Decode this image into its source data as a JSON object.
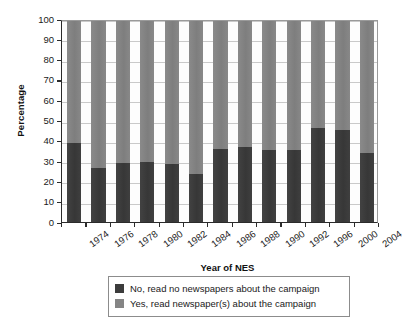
{
  "chart_data": {
    "type": "bar",
    "subtype": "stacked-bar-100-percent",
    "title": "",
    "xlabel": "Year of NES",
    "ylabel": "Percentage",
    "ylim": [
      0,
      100
    ],
    "ytick_step": 10,
    "yticks": [
      0,
      10,
      20,
      30,
      40,
      50,
      60,
      70,
      80,
      90,
      100
    ],
    "grid": true,
    "grid_axis": "y",
    "legend_position": "below-center",
    "categories": [
      "1974",
      "1976",
      "1978",
      "1980",
      "1982",
      "1984",
      "1986",
      "1988",
      "1990",
      "1992",
      "1996",
      "2000",
      "2004"
    ],
    "series": [
      {
        "name": "No, read no newspapers about the campaign",
        "color": "#3c3c3c",
        "values": [
          39,
          26.5,
          29,
          29.5,
          28.5,
          23.5,
          36,
          37,
          35.5,
          35.5,
          46.5,
          45.5,
          34
        ]
      },
      {
        "name": "Yes, read newspaper(s) about the campaign",
        "color": "#858585",
        "values": [
          61,
          73.5,
          71,
          70.5,
          71.5,
          76.5,
          64,
          63,
          64.5,
          64.5,
          53.5,
          54.5,
          66
        ]
      }
    ]
  },
  "axes": {
    "y_title": "Percentage",
    "x_title": "Year of NES",
    "y_tick_labels": [
      "100",
      "90",
      "80",
      "70",
      "60",
      "50",
      "40",
      "30",
      "20",
      "10",
      "0"
    ],
    "x_tick_labels": [
      "1974",
      "1976",
      "1978",
      "1980",
      "1982",
      "1984",
      "1986",
      "1988",
      "1990",
      "1992",
      "1996",
      "2000",
      "2004"
    ]
  },
  "legend": {
    "items": [
      {
        "label": "No, read no newspapers about the campaign",
        "color": "#3c3c3c",
        "swatch": "dark-gray-swatch"
      },
      {
        "label": "Yes, read newspaper(s) about the campaign",
        "color": "#858585",
        "swatch": "medium-gray-swatch"
      }
    ]
  },
  "colors": {
    "series_no": "#3c3c3c",
    "series_yes": "#858585",
    "axis": "#2b2b2b",
    "gridline": "#c9c9c9",
    "background": "#ffffff"
  }
}
